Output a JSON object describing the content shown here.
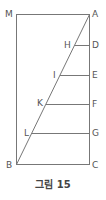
{
  "figure": {
    "caption": "그림 15",
    "line_color": "#777777",
    "points": {
      "M": {
        "label": "M"
      },
      "A": {
        "label": "A"
      },
      "B": {
        "label": "B"
      },
      "C": {
        "label": "C"
      },
      "D": {
        "label": "D"
      },
      "E": {
        "label": "E"
      },
      "F": {
        "label": "F"
      },
      "G": {
        "label": "G"
      },
      "H": {
        "label": "H"
      },
      "I": {
        "label": "I"
      },
      "K": {
        "label": "K"
      },
      "L": {
        "label": "L"
      }
    }
  }
}
